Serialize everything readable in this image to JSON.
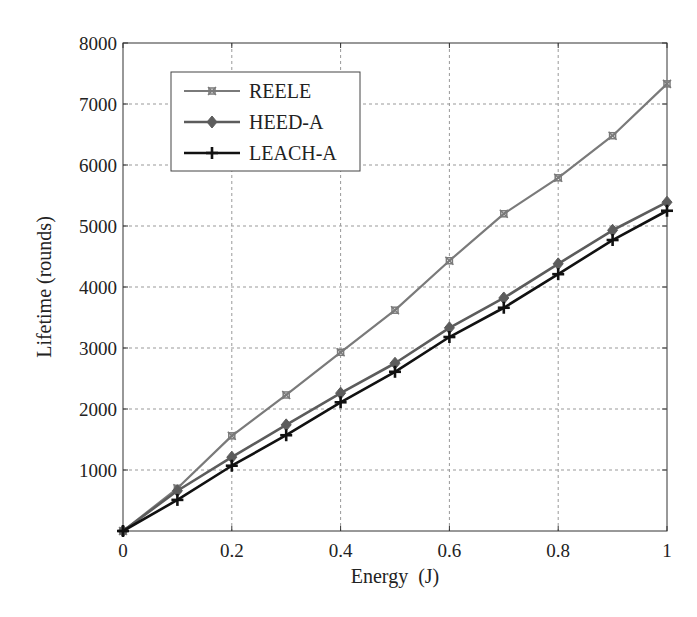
{
  "chart_data": {
    "type": "line",
    "title": "",
    "xlabel": "Energy  (J)",
    "ylabel": "Lifetime (rounds)",
    "xlim": [
      0,
      1
    ],
    "ylim": [
      0,
      8000
    ],
    "grid": true,
    "legend_position": "upper left",
    "x": [
      0,
      0.1,
      0.2,
      0.3,
      0.4,
      0.5,
      0.6,
      0.7,
      0.8,
      0.9,
      1.0
    ],
    "x_ticks": [
      "0",
      "0.2",
      "0.4",
      "0.6",
      "0.8",
      "1"
    ],
    "x_tick_values": [
      0,
      0.2,
      0.4,
      0.6,
      0.8,
      1.0
    ],
    "y_ticks": [
      "1000",
      "2000",
      "3000",
      "4000",
      "5000",
      "6000",
      "7000",
      "8000"
    ],
    "y_tick_values": [
      1000,
      2000,
      3000,
      4000,
      5000,
      6000,
      7000,
      8000
    ],
    "series": [
      {
        "name": "REELE",
        "marker": "x-square",
        "color": "#7a7a7a",
        "width": 2.2,
        "values": [
          0,
          700,
          1560,
          2230,
          2930,
          3620,
          4430,
          5200,
          5790,
          6480,
          7330
        ]
      },
      {
        "name": "HEED-A",
        "marker": "diamond",
        "color": "#5c5c5c",
        "width": 2.6,
        "values": [
          0,
          660,
          1210,
          1740,
          2260,
          2750,
          3330,
          3820,
          4380,
          4930,
          5390
        ]
      },
      {
        "name": "LEACH-A",
        "marker": "plus",
        "color": "#111111",
        "width": 2.6,
        "values": [
          0,
          510,
          1070,
          1570,
          2110,
          2610,
          3180,
          3660,
          4210,
          4770,
          5250
        ]
      }
    ]
  }
}
